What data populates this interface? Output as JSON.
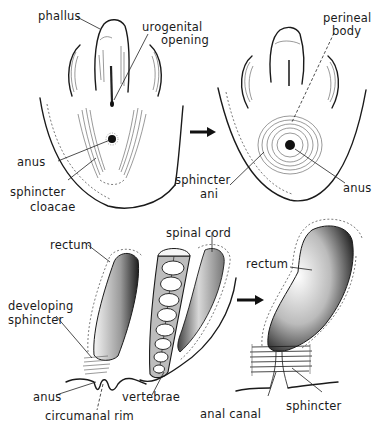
{
  "figure": {
    "panels": [
      {
        "id": "external-cloaca",
        "labels": {
          "phallus": "phallus",
          "urogenital_opening_1": "urogenital",
          "urogenital_opening_2": "opening",
          "anus": "anus",
          "sphincter_cloacae_1": "sphincter",
          "sphincter_cloacae_2": "cloacae"
        }
      },
      {
        "id": "external-perineum",
        "labels": {
          "perineal_body_1": "perineal",
          "perineal_body_2": "body",
          "sphincter_ani_1": "sphincter",
          "sphincter_ani_2": "ani",
          "anus": "anus"
        }
      },
      {
        "id": "section-developing",
        "labels": {
          "rectum": "rectum",
          "spinal_cord": "spinal cord",
          "developing_sphincter_1": "developing",
          "developing_sphincter_2": "sphincter",
          "anus": "anus",
          "circumanal_rim": "circumanal rim",
          "vertebrae": "vertebrae"
        }
      },
      {
        "id": "section-mature",
        "labels": {
          "rectum": "rectum",
          "anal_canal": "anal canal",
          "sphincter": "sphincter"
        }
      }
    ],
    "colors": {
      "ink": "#1a1a1a",
      "vertebral_fill": "#bdbdbd",
      "background": "#ffffff"
    }
  }
}
